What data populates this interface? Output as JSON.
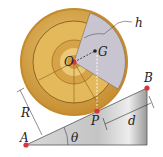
{
  "diagram": {
    "labels": {
      "h": "h",
      "O": "O",
      "G": "G",
      "B": "B",
      "R": "R",
      "P": "P",
      "d": "d",
      "A": "A",
      "theta": "θ"
    },
    "colors": {
      "disk_outer": "#d9a441",
      "disk_dark_ring": "#b8832a",
      "disk_inner": "#e8c26a",
      "sector": "#c9c6d2",
      "incline_light": "#e6e6e6",
      "incline_dark": "#9c9c9c",
      "point_red": "#d8343b",
      "line": "#333333"
    }
  }
}
